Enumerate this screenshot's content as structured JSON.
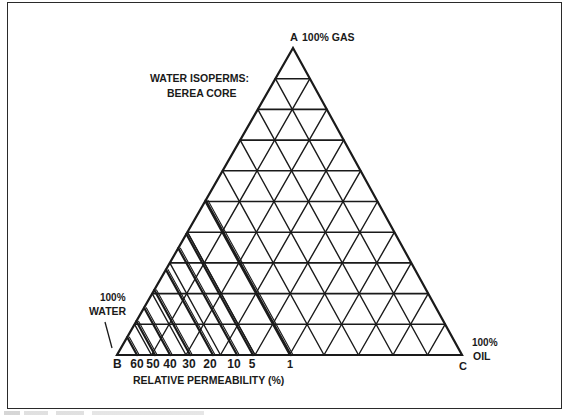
{
  "diagram": {
    "type": "ternary",
    "title": "WATER ISOPERMS:",
    "subtitle": "BEREA CORE",
    "vertices": {
      "top": {
        "letter": "A",
        "label": "100% GAS"
      },
      "left": {
        "letter": "B",
        "label_line1": "100%",
        "label_line2": "WATER"
      },
      "right": {
        "letter": "C",
        "label_line1": "100%",
        "label_line2": "OIL"
      }
    },
    "grid_divisions": 10,
    "axis_title": "RELATIVE PERMEABILITY (%)",
    "isoperms": [
      {
        "value": "60",
        "base_fraction": 0.058
      },
      {
        "value": "50",
        "base_fraction": 0.11
      },
      {
        "value": "40",
        "base_fraction": 0.154
      },
      {
        "value": "30",
        "base_fraction": 0.212
      },
      {
        "value": "20",
        "base_fraction": 0.278
      },
      {
        "value": "10",
        "base_fraction": 0.348
      },
      {
        "value": "5",
        "base_fraction": 0.394
      },
      {
        "value": "1",
        "base_fraction": 0.504
      }
    ],
    "colors": {
      "line": "#1a1a1a",
      "background": "#ffffff"
    }
  }
}
